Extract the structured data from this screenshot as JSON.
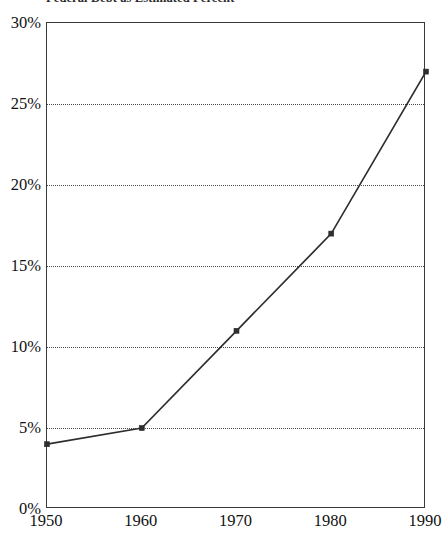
{
  "chart_data": {
    "type": "line",
    "title": "Federal Debt as Estimated Percent",
    "xlabel": "",
    "ylabel": "",
    "x": [
      1950,
      1960,
      1970,
      1980,
      1990
    ],
    "categories": [
      "1950",
      "1960",
      "1970",
      "1980",
      "1990"
    ],
    "values": [
      4,
      5,
      11,
      17,
      27
    ],
    "series": [
      {
        "name": "Federal Debt as Percent",
        "values": [
          4,
          5,
          11,
          17,
          27
        ]
      }
    ],
    "xtick_labels": [
      "1950",
      "1960",
      "1970",
      "1980",
      "1990"
    ],
    "ytick_labels": [
      "0%",
      "5%",
      "10%",
      "15%",
      "20%",
      "25%",
      "30%"
    ],
    "ytick_values": [
      0,
      5,
      10,
      15,
      20,
      25,
      30
    ],
    "ylim": [
      0,
      30
    ],
    "xlim": [
      1950,
      1990
    ],
    "grid": "horizontal-dotted",
    "legend": "none",
    "marker": "square",
    "line_color": "#2e2e2e",
    "grid_color": "#4a4a4a",
    "axis_color": "#3a3a3a",
    "unit": "percent"
  },
  "axes": {
    "y_ticks": [
      {
        "label": "30%",
        "value": 30
      },
      {
        "label": "25%",
        "value": 25
      },
      {
        "label": "20%",
        "value": 20
      },
      {
        "label": "15%",
        "value": 15
      },
      {
        "label": "10%",
        "value": 10
      },
      {
        "label": "5%",
        "value": 5
      },
      {
        "label": "0%",
        "value": 0
      }
    ],
    "x_ticks": [
      {
        "label": "1950",
        "value": 1950
      },
      {
        "label": "1960",
        "value": 1960
      },
      {
        "label": "1970",
        "value": 1970
      },
      {
        "label": "1980",
        "value": 1980
      },
      {
        "label": "1990",
        "value": 1990
      }
    ]
  }
}
